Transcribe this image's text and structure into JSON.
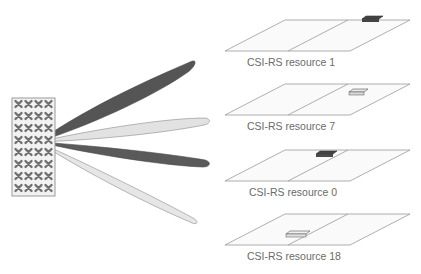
{
  "diagram": {
    "antenna_panel": {
      "rows": 8,
      "cols": 4,
      "element_glyph": "cross-polarized-element"
    },
    "beams": [
      {
        "name": "beam-1",
        "shade": "dark"
      },
      {
        "name": "beam-7",
        "shade": "light"
      },
      {
        "name": "beam-0",
        "shade": "dark"
      },
      {
        "name": "beam-18",
        "shade": "light"
      }
    ],
    "resources": [
      {
        "label": "CSI-RS resource 1",
        "block_shade": "dark"
      },
      {
        "label": "CSI-RS resource 7",
        "block_shade": "light"
      },
      {
        "label": "CSI-RS resource 0",
        "block_shade": "dark"
      },
      {
        "label": "CSI-RS resource 18",
        "block_shade": "light"
      }
    ],
    "colors": {
      "dark": "#555555",
      "light": "#e2e2e2",
      "outline": "#8a8a8a",
      "text": "#6a6a6a"
    }
  }
}
